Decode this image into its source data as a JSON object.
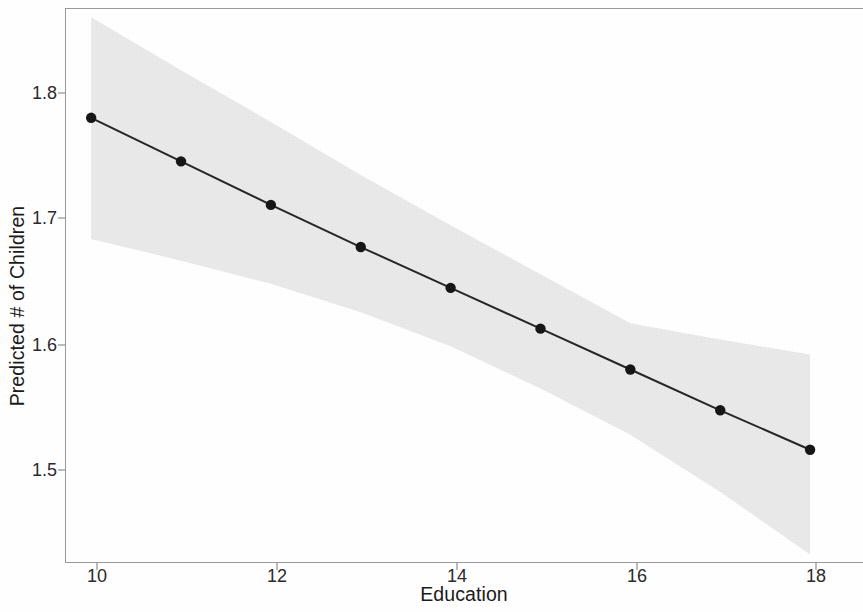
{
  "chart_data": {
    "type": "line",
    "title": "",
    "subtitle": "",
    "xlabel": "Education",
    "ylabel": "Predicted # of Children",
    "x": [
      10,
      11,
      12,
      13,
      14,
      15,
      16,
      17,
      18
    ],
    "values": [
      1.765,
      1.733,
      1.701,
      1.67,
      1.64,
      1.61,
      1.58,
      1.55,
      1.521
    ],
    "series": [
      {
        "name": "Predicted # of Children",
        "values": [
          1.765,
          1.733,
          1.701,
          1.67,
          1.64,
          1.61,
          1.58,
          1.55,
          1.521
        ]
      }
    ],
    "confidence_band": {
      "label": "95% confidence interval",
      "upper": [
        1.839,
        1.8,
        1.762,
        1.723,
        1.686,
        1.65,
        1.614,
        1.602,
        1.591
      ],
      "lower": [
        1.676,
        1.66,
        1.643,
        1.622,
        1.597,
        1.566,
        1.532,
        1.49,
        1.444
      ]
    },
    "xlim": [
      9.72,
      18.6
    ],
    "ylim": [
      1.437,
      1.845
    ],
    "xticks": [
      10,
      12,
      14,
      16,
      18
    ],
    "yticks": [
      1.5,
      1.6,
      1.7,
      1.8
    ],
    "xtick_labels": [
      "10",
      "12",
      "14",
      "16",
      "18"
    ],
    "ytick_labels": [
      "1.5",
      "1.6",
      "1.7",
      "1.8"
    ],
    "grid": false,
    "legend": "none",
    "colors": {
      "line": "#262626",
      "point": "#161616",
      "band": "#e9e9e9",
      "axis": "#9a9a9a",
      "text": "#1b1b1b"
    },
    "marker": "filled-circle",
    "marker_size": 5.2,
    "line_width": 2.0
  }
}
